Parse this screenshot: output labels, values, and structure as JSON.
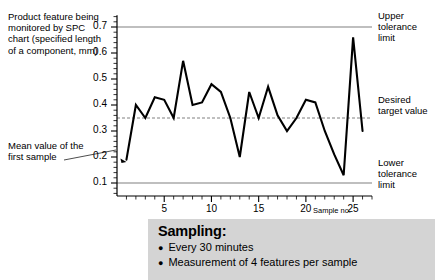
{
  "captions": {
    "feature": "Product feature being monitored by SPC chart (specified length of a component, mm)",
    "mean": "Mean value of the first sample",
    "upper_tolerance": "Upper tolerance limit",
    "target": "Desired target value",
    "lower_tolerance": "Lower tolerance limit"
  },
  "sampling": {
    "title": "Sampling:",
    "items": [
      "Every 30 minutes",
      "Measurement of 4 features per sample"
    ],
    "bullet": "●",
    "background": "#d4d4d4"
  },
  "colors": {
    "line": "#000000",
    "tolerance_line": "#808080",
    "target_line": "#808080",
    "axis": "#000000",
    "background": "#ffffff"
  },
  "chart_data": {
    "type": "line",
    "title": "",
    "subtitle": "",
    "xlabel": "Sample no.",
    "ylabel": "",
    "xlim": [
      0,
      27
    ],
    "ylim": [
      0.05,
      0.75
    ],
    "grid": false,
    "legend_position": "none",
    "x": [
      1,
      2,
      3,
      4,
      5,
      6,
      7,
      8,
      9,
      10,
      11,
      12,
      13,
      14,
      15,
      16,
      17,
      18,
      19,
      20,
      21,
      22,
      23,
      24,
      25,
      26
    ],
    "series": [
      {
        "name": "Sample mean",
        "values": [
          0.19,
          0.4,
          0.35,
          0.43,
          0.42,
          0.35,
          0.57,
          0.4,
          0.41,
          0.48,
          0.45,
          0.35,
          0.2,
          0.45,
          0.35,
          0.47,
          0.36,
          0.3,
          0.35,
          0.42,
          0.41,
          0.3,
          0.21,
          0.13,
          0.66,
          0.3
        ]
      }
    ],
    "ytick_labels": [
      "0.1",
      "0.2",
      "0.3",
      "0.4",
      "0.5",
      "0.6",
      "0.7"
    ],
    "ytick_values": [
      0.1,
      0.2,
      0.3,
      0.4,
      0.5,
      0.6,
      0.7
    ],
    "xtick_labels": [
      "5",
      "10",
      "15",
      "20",
      "25"
    ],
    "xtick_values": [
      5,
      10,
      15,
      20,
      25
    ],
    "x_minor_ticks": [
      1,
      2,
      3,
      4,
      5,
      6,
      7,
      8,
      9,
      10,
      11,
      12,
      13,
      14,
      15,
      16,
      17,
      18,
      19,
      20,
      21,
      22,
      23,
      24,
      25,
      26,
      27
    ],
    "reference_lines": [
      {
        "name": "upper-tolerance-limit",
        "value": 0.7,
        "style": "solid"
      },
      {
        "name": "desired-target-value",
        "value": 0.35,
        "style": "dashed"
      },
      {
        "name": "lower-tolerance-limit",
        "value": 0.1,
        "style": "solid"
      }
    ]
  }
}
